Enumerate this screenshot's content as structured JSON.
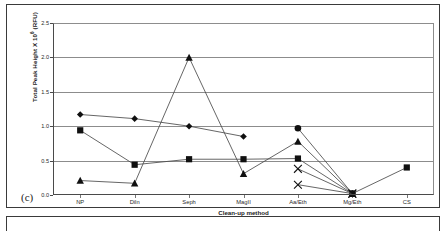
{
  "panel": {
    "letter": "(c)"
  },
  "chart_data": {
    "type": "line",
    "title": "",
    "subtitle": "",
    "xlabel": "Clean-up method",
    "ylabel": "Total Peak Height X 10⁶ (RFU)",
    "ylabel_base": "Total Peak Height X 10",
    "ylabel_exp": "6",
    "ylabel_unit": " (RFU)",
    "categories": [
      "NP",
      "Diln",
      "Seph",
      "MagII",
      "Aa/Eth",
      "Mg/Eth",
      "CS"
    ],
    "ylim": [
      0.0,
      2.5
    ],
    "yticks": [
      0.0,
      0.5,
      1.0,
      1.5,
      2.0,
      2.5
    ],
    "ytick_labels": [
      "0.0",
      "0.5",
      "1.0",
      "1.5",
      "2.0",
      "2.5"
    ],
    "grid": true,
    "grid_axis": "y",
    "legend": false,
    "legend_position": "none",
    "marker_color": "#101010",
    "line_color": "#4a4a4a",
    "series": [
      {
        "name": "Series 1",
        "marker": "diamond",
        "values": [
          1.17,
          1.11,
          1.0,
          0.85,
          null,
          null,
          null
        ]
      },
      {
        "name": "Series 2",
        "marker": "square",
        "values": [
          0.94,
          0.44,
          0.52,
          0.52,
          0.53,
          0.02,
          0.4
        ]
      },
      {
        "name": "Series 3",
        "marker": "triangle",
        "values": [
          0.21,
          0.17,
          2.0,
          0.31,
          0.78,
          0.02,
          null
        ]
      },
      {
        "name": "Series 4",
        "marker": "circle",
        "values": [
          null,
          null,
          null,
          null,
          0.97,
          0.02,
          null
        ]
      },
      {
        "name": "Series 5",
        "marker": "cross",
        "values": [
          null,
          null,
          null,
          null,
          0.38,
          0.02,
          null
        ]
      },
      {
        "name": "Series 6",
        "marker": "cross",
        "values": [
          null,
          null,
          null,
          null,
          0.15,
          0.02,
          null
        ]
      }
    ]
  }
}
